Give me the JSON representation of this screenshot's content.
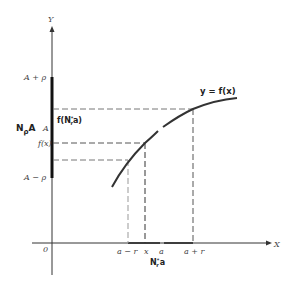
{
  "diagram": {
    "axes": {
      "x_label": "X",
      "y_label": "Y",
      "origin_label": "0"
    },
    "curve_label": "y = f(x)",
    "y_labels": {
      "upper": "A + ρ",
      "center": "A",
      "lower": "A − ρ",
      "fx": "f(x)",
      "f_neighborhood": "f(N",
      "f_neighborhood_sub": "r",
      "f_neighborhood_sup": "*",
      "f_neighborhood_tail": "a)",
      "neighborhood_A": "N",
      "neighborhood_A_sub": "ρ",
      "neighborhood_A_tail": "A"
    },
    "x_labels": {
      "a_minus_r": "a − r",
      "x": "x",
      "a": "a",
      "a_plus_r": "a + r",
      "neighborhood_a": "N",
      "neighborhood_a_sub": "r",
      "neighborhood_a_sup": "*",
      "neighborhood_a_tail": "a"
    },
    "colors": {
      "line": "#333333",
      "dash": "#777777",
      "text": "#444444"
    }
  }
}
